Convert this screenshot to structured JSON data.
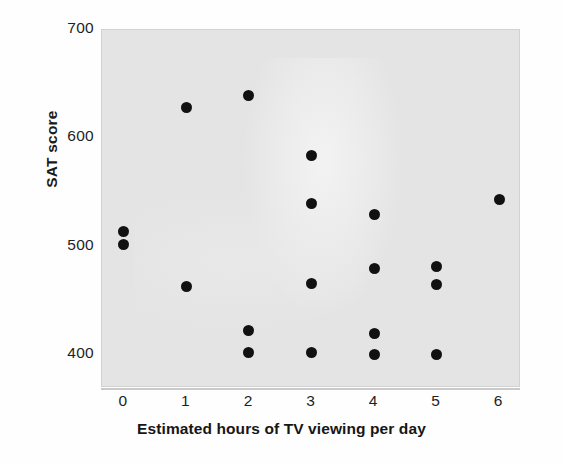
{
  "chart_data": {
    "type": "scatter",
    "title": "",
    "xlabel": "Estimated hours of TV viewing per day",
    "ylabel": "SAT score",
    "xlim": [
      -0.35,
      6.35
    ],
    "ylim": [
      370,
      700
    ],
    "xticks": [
      0,
      1,
      2,
      3,
      4,
      5,
      6
    ],
    "xtick_labels": [
      "0",
      "1",
      "2",
      "3",
      "4",
      "5",
      "6"
    ],
    "yticks": [
      400,
      500,
      600,
      700
    ],
    "ytick_labels": [
      "400",
      "500",
      "600",
      "700"
    ],
    "grid": false,
    "legend": null,
    "marker": "filled-circle",
    "marker_color": "#111111",
    "plot_background": "#e4e4e4",
    "figure_background": "#ffffff",
    "points": [
      {
        "x": 0,
        "y": 514
      },
      {
        "x": 0,
        "y": 502
      },
      {
        "x": 1,
        "y": 629
      },
      {
        "x": 1,
        "y": 464
      },
      {
        "x": 2,
        "y": 640
      },
      {
        "x": 2,
        "y": 423
      },
      {
        "x": 2,
        "y": 403
      },
      {
        "x": 3,
        "y": 584
      },
      {
        "x": 3,
        "y": 540
      },
      {
        "x": 3,
        "y": 466
      },
      {
        "x": 3,
        "y": 403
      },
      {
        "x": 4,
        "y": 530
      },
      {
        "x": 4,
        "y": 480
      },
      {
        "x": 4,
        "y": 420
      },
      {
        "x": 4,
        "y": 401
      },
      {
        "x": 5,
        "y": 482
      },
      {
        "x": 5,
        "y": 465
      },
      {
        "x": 5,
        "y": 401
      },
      {
        "x": 6,
        "y": 544
      }
    ]
  }
}
